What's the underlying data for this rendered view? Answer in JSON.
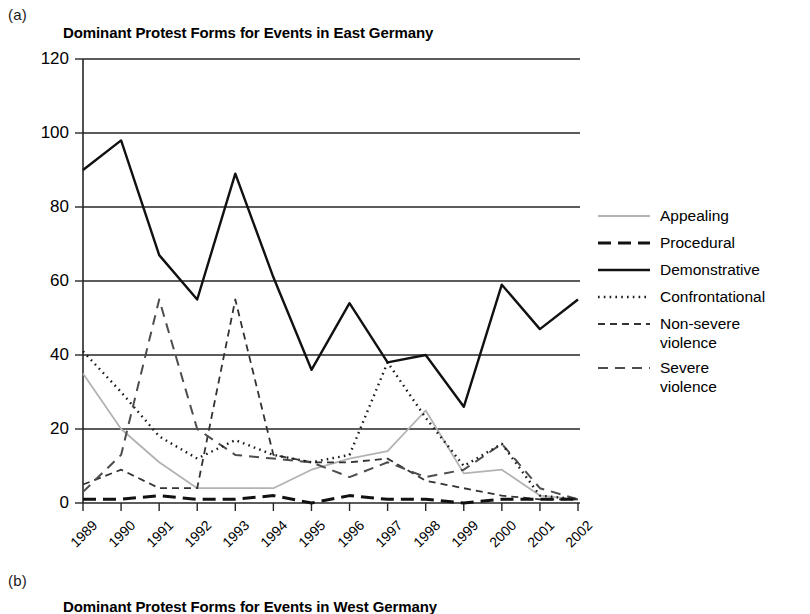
{
  "panel_a_letter": "(a)",
  "panel_b_letter": "(b)",
  "panel_b_title": "Dominant Protest Forms for Events in West Germany",
  "legend": {
    "items": [
      {
        "label": "Appealing",
        "style": "solid-light"
      },
      {
        "label": "Procedural",
        "style": "long-dash"
      },
      {
        "label": "Demonstrative",
        "style": "solid-bold"
      },
      {
        "label": "Confrontational",
        "style": "dotted"
      },
      {
        "label": "Non-severe\nviolence",
        "style": "short-dash"
      },
      {
        "label": "Severe\nviolence",
        "style": "medium-dash"
      }
    ]
  },
  "chart_data": {
    "type": "line",
    "title": "Dominant Protest Forms for Events in East Germany",
    "xlabel": "",
    "ylabel": "",
    "ylim": [
      0,
      120
    ],
    "ytick_step": 20,
    "yticks": [
      0,
      20,
      40,
      60,
      80,
      100,
      120
    ],
    "grid": true,
    "legend_position": "right",
    "categories": [
      "1989",
      "1990",
      "1991",
      "1992",
      "1993",
      "1994",
      "1995",
      "1996",
      "1997",
      "1998",
      "1999",
      "2000",
      "2001",
      "2002"
    ],
    "series": [
      {
        "name": "Appealing",
        "style": "solid-light",
        "color": "#b3b3b3",
        "values": [
          35,
          20,
          11,
          4,
          4,
          4,
          9,
          12,
          14,
          25,
          8,
          9,
          2,
          1
        ]
      },
      {
        "name": "Procedural",
        "style": "long-dash",
        "color": "#111111",
        "values": [
          1,
          1,
          2,
          1,
          1,
          2,
          0,
          2,
          1,
          1,
          0,
          1,
          1,
          1
        ]
      },
      {
        "name": "Demonstrative",
        "style": "solid-bold",
        "color": "#111111",
        "values": [
          90,
          98,
          67,
          55,
          89,
          61,
          36,
          54,
          38,
          40,
          26,
          59,
          47,
          55
        ]
      },
      {
        "name": "Confrontational",
        "style": "dotted",
        "color": "#1a1a1a",
        "values": [
          41,
          30,
          18,
          12,
          17,
          13,
          11,
          13,
          38,
          23,
          10,
          16,
          2,
          1
        ]
      },
      {
        "name": "Non-severe violence",
        "style": "short-dash",
        "color": "#333333",
        "values": [
          5,
          9,
          4,
          4,
          55,
          13,
          11,
          11,
          12,
          6,
          4,
          2,
          1,
          1
        ]
      },
      {
        "name": "Severe violence",
        "style": "medium-dash",
        "color": "#4d4d4d",
        "values": [
          3,
          13,
          55,
          20,
          13,
          12,
          11,
          7,
          11,
          7,
          9,
          16,
          4,
          1
        ]
      }
    ]
  }
}
